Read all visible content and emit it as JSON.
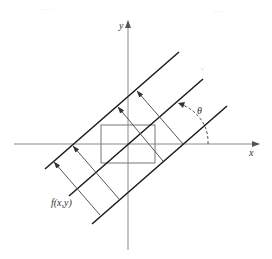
{
  "diagram": {
    "axes": {
      "x_label": "x",
      "y_label": "y"
    },
    "labels": {
      "theta": "θ",
      "function": "f(x,y)",
      "faint_s": "s"
    },
    "faint_header": {
      "left": "······",
      "right": "······"
    },
    "colors": {
      "axis": "#8a8a8a",
      "band_line": "#1a1a1a",
      "ray": "#555555",
      "background": "#ffffff"
    },
    "elements": {
      "parallel_lines_count": 3,
      "projection_rays_count": 4,
      "support_rectangle": true,
      "angle_arc": "dashed"
    }
  }
}
